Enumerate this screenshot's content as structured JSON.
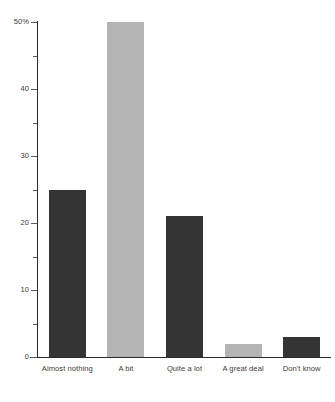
{
  "chart_data": {
    "type": "bar",
    "title": "",
    "subtitle": "",
    "xlabel": "",
    "ylabel": "",
    "categories": [
      "Almost nothing",
      "A bit",
      "Quite a lot",
      "A great deal",
      "Don't know"
    ],
    "values": [
      25,
      50,
      21,
      2,
      3
    ],
    "bar_colors": [
      "#343434",
      "#b4b4b4",
      "#343434",
      "#b4b4b4",
      "#343434"
    ],
    "ylim": [
      0,
      50
    ],
    "ytick_values": [
      0,
      10,
      20,
      30,
      40,
      50
    ],
    "ytick_labels": [
      "0",
      "10",
      "20",
      "30",
      "40",
      "50%"
    ],
    "yminor_tick_values": [
      5,
      15,
      25,
      35,
      45
    ],
    "grid": false,
    "legend": null,
    "axis_color": "#2b2b2b",
    "text_color": "#3d3d3d",
    "background": "#ffffff"
  }
}
